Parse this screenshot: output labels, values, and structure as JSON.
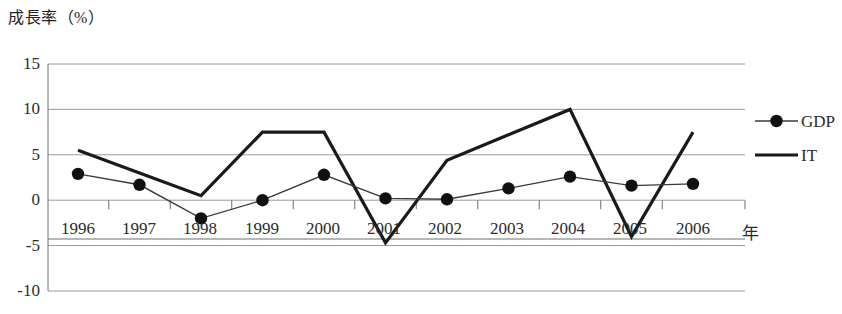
{
  "chart_data": {
    "type": "line",
    "title": "成長率（%）",
    "ylabel": "成長率（%）",
    "xlabel": "年",
    "xlabel_unit": "年",
    "categories": [
      "1996",
      "1997",
      "1998",
      "1999",
      "2000",
      "2001",
      "2002",
      "2003",
      "2004",
      "2005",
      "2006"
    ],
    "x": [
      1996,
      1997,
      1998,
      1999,
      2000,
      2001,
      2002,
      2003,
      2004,
      2005,
      2006
    ],
    "series": [
      {
        "name": "GDP",
        "marker": "filled-circle",
        "values": [
          2.9,
          1.7,
          -2.0,
          0.0,
          2.8,
          0.2,
          0.1,
          1.3,
          2.6,
          1.6,
          1.8
        ]
      },
      {
        "name": "IT",
        "marker": "none",
        "values": [
          5.5,
          3.0,
          0.5,
          7.5,
          7.5,
          -4.7,
          4.4,
          7.2,
          10.0,
          -4.0,
          7.5
        ]
      }
    ],
    "ylim": [
      -10,
      15
    ],
    "yticks": [
      15,
      10,
      5,
      0,
      -5,
      -10
    ],
    "ytick_labels": [
      "15",
      "10",
      "5",
      "0",
      "-5",
      "-10"
    ],
    "grid": true,
    "legend_position": "right",
    "legend_entries": [
      "GDP",
      "IT"
    ],
    "colors": {
      "gdp_line": "#3a3a3a",
      "it_line": "#1a1a1a",
      "grid": "#9a9a9a",
      "axis": "#6e6e6e",
      "text": "#2b2b2b"
    }
  }
}
